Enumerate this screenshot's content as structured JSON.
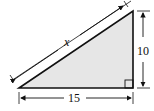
{
  "diagram": {
    "type": "right-triangle",
    "fill_color": "#e6e6e6",
    "stroke_color": "#111111",
    "labels": {
      "hypotenuse": "x",
      "vertical_leg": "10",
      "horizontal_leg": "15"
    },
    "right_angle_marker": "bottom-right"
  }
}
